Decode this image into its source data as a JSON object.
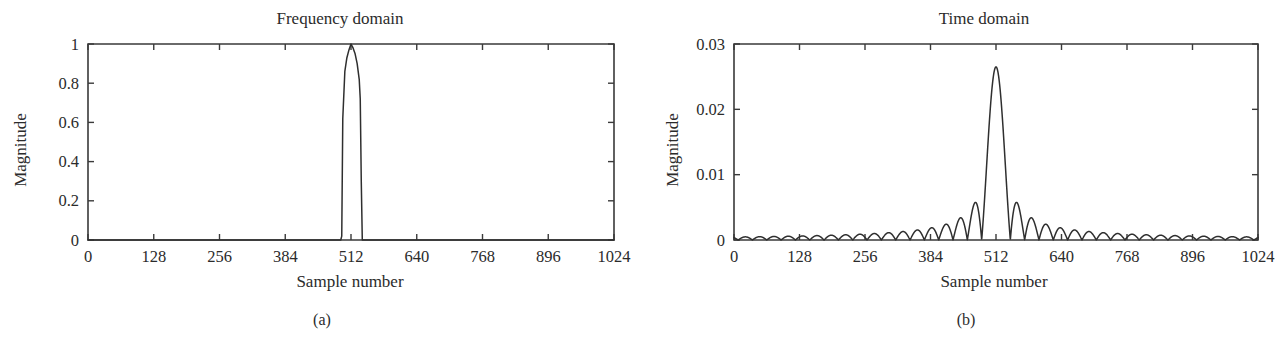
{
  "figure": {
    "background_color": "#ffffff",
    "line_color": "#2f2f2f",
    "axis_color": "#3a3a3a"
  },
  "panels": [
    {
      "caption": "(a)",
      "chart_index": 0
    },
    {
      "caption": "(b)",
      "chart_index": 1
    }
  ],
  "chart_data": [
    {
      "type": "line",
      "title": "Frequency domain",
      "xlabel": "Sample number",
      "ylabel": "Magnitude",
      "xlim": [
        0,
        1024
      ],
      "ylim": [
        0,
        1
      ],
      "grid": false,
      "legend": null,
      "xticks": [
        0,
        128,
        256,
        384,
        512,
        640,
        768,
        896,
        1024
      ],
      "xticklabels": [
        "0",
        "128",
        "256",
        "384",
        "512",
        "640",
        "768",
        "896",
        "1024"
      ],
      "yticks": [
        0,
        0.2,
        0.4,
        0.6,
        0.8,
        1
      ],
      "yticklabels": [
        "0",
        "0.2",
        "0.4",
        "0.6",
        "0.8",
        "1"
      ],
      "description": "Narrow rectangular bandpass pulse centered at sample 512, magnitude 1, width about 35 samples, zero elsewhere",
      "x": [
        0,
        60,
        120,
        180,
        240,
        300,
        360,
        420,
        470,
        492,
        494,
        496,
        500,
        504,
        508,
        512,
        516,
        520,
        524,
        528,
        530,
        532,
        534,
        580,
        640,
        700,
        760,
        820,
        880,
        940,
        1000,
        1024
      ],
      "y": [
        0,
        0,
        0,
        0,
        0,
        0,
        0,
        0,
        0,
        0,
        0.02,
        0.62,
        0.86,
        0.93,
        0.97,
        1.0,
        0.98,
        0.95,
        0.9,
        0.82,
        0.72,
        0.3,
        0,
        0,
        0,
        0,
        0,
        0,
        0,
        0,
        0,
        0
      ]
    },
    {
      "type": "line",
      "title": "Time domain",
      "xlabel": "Sample number",
      "ylabel": "Magnitude",
      "xlim": [
        0,
        1024
      ],
      "ylim": [
        0,
        0.03
      ],
      "grid": false,
      "legend": null,
      "xticks": [
        0,
        128,
        256,
        384,
        512,
        640,
        768,
        896,
        1024
      ],
      "xticklabels": [
        "0",
        "128",
        "256",
        "384",
        "512",
        "640",
        "768",
        "896",
        "1024"
      ],
      "yticks": [
        0,
        0.01,
        0.02,
        0.03
      ],
      "yticklabels": [
        "0",
        "0.01",
        "0.02",
        "0.03"
      ],
      "description": "Rectified sinc (absolute value) envelope centered at sample 512 with main lobe peak about 0.0265 and decaying side lobes across the full range",
      "main_peak": {
        "x": 512,
        "y": 0.0265
      },
      "sinc": {
        "center": 512,
        "amplitude": 0.0265,
        "lobe_half_width": 28,
        "rectified": true
      }
    }
  ]
}
